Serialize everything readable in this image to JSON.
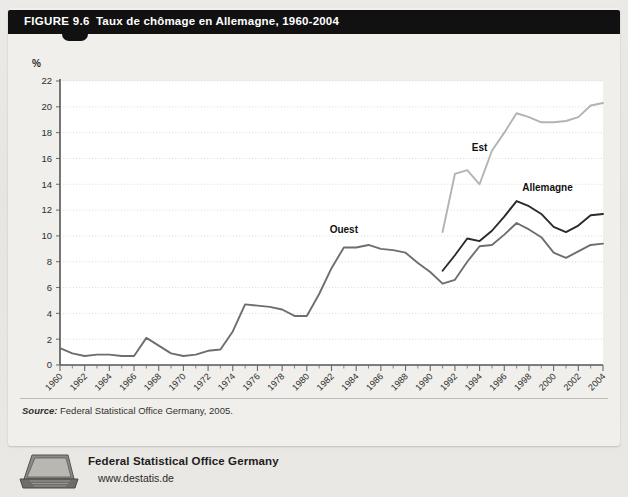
{
  "figure": {
    "number_label": "FIGURE 9.6",
    "title": "Taux de chômage en Allemagne, 1960-2004"
  },
  "source": {
    "prefix": "Source:",
    "text": " Federal Statistical Office Germany, 2005."
  },
  "footer": {
    "organization": "Federal Statistical Office Germany",
    "website": "www.destatis.de",
    "icon": "laptop-icon"
  },
  "colors": {
    "titlebar_bg": "#111111",
    "page_bg": "#eceae6",
    "plot_bg": "#ffffff",
    "est_line": "#b3b3b3",
    "allemagne_line": "#2a2a2a",
    "ouest_line": "#6e6e6e",
    "grid": "#cfcfcf",
    "axis": "#6a6a6a"
  },
  "chart_data": {
    "type": "line",
    "title": "Taux de chômage en Allemagne, 1960-2004",
    "xlabel": "",
    "ylabel": "%",
    "ylim": [
      0,
      22
    ],
    "xlim": [
      1960,
      2004
    ],
    "ytick_step": 2,
    "yticks": [
      0,
      2,
      4,
      6,
      8,
      10,
      12,
      14,
      16,
      18,
      20,
      22
    ],
    "xticks": [
      1960,
      1962,
      1964,
      1966,
      1968,
      1970,
      1972,
      1974,
      1976,
      1978,
      1980,
      1982,
      1984,
      1986,
      1988,
      1990,
      1992,
      1994,
      1996,
      1998,
      2000,
      2002,
      2004
    ],
    "grid": "horizontal-dotted",
    "legend_position": "inline-annotations",
    "annotations": [
      {
        "label": "Ouest",
        "x": 1983,
        "y": 10.2
      },
      {
        "label": "Est",
        "x": 1994,
        "y": 16.6
      },
      {
        "label": "Allemagne",
        "x": 1999.5,
        "y": 13.5
      }
    ],
    "series": [
      {
        "name": "Ouest",
        "color": "#6e6e6e",
        "x": [
          1960,
          1961,
          1962,
          1963,
          1964,
          1965,
          1966,
          1967,
          1968,
          1969,
          1970,
          1971,
          1972,
          1973,
          1974,
          1975,
          1976,
          1977,
          1978,
          1979,
          1980,
          1981,
          1982,
          1983,
          1984,
          1985,
          1986,
          1987,
          1988,
          1989,
          1990,
          1991,
          1992,
          1993,
          1994,
          1995,
          1996,
          1997,
          1998,
          1999,
          2000,
          2001,
          2002,
          2003,
          2004
        ],
        "values": [
          1.3,
          0.9,
          0.7,
          0.8,
          0.8,
          0.7,
          0.7,
          2.1,
          1.5,
          0.9,
          0.7,
          0.8,
          1.1,
          1.2,
          2.6,
          4.7,
          4.6,
          4.5,
          4.3,
          3.8,
          3.8,
          5.5,
          7.5,
          9.1,
          9.1,
          9.3,
          9.0,
          8.9,
          8.7,
          7.9,
          7.2,
          6.3,
          6.6,
          8.0,
          9.2,
          9.3,
          10.1,
          11.0,
          10.5,
          9.9,
          8.7,
          8.3,
          8.8,
          9.3,
          9.4
        ]
      },
      {
        "name": "Est",
        "color": "#b3b3b3",
        "x": [
          1991,
          1992,
          1993,
          1994,
          1995,
          1996,
          1997,
          1998,
          1999,
          2000,
          2001,
          2002,
          2003,
          2004
        ],
        "values": [
          10.3,
          14.8,
          15.1,
          14.0,
          16.6,
          18.0,
          19.5,
          19.2,
          18.8,
          18.8,
          18.9,
          19.2,
          20.1,
          20.3
        ]
      },
      {
        "name": "Allemagne",
        "color": "#2a2a2a",
        "x": [
          1991,
          1992,
          1993,
          1994,
          1995,
          1996,
          1997,
          1998,
          1999,
          2000,
          2001,
          2002,
          2003,
          2004
        ],
        "values": [
          7.3,
          8.5,
          9.8,
          9.6,
          10.4,
          11.5,
          12.7,
          12.3,
          11.7,
          10.7,
          10.3,
          10.8,
          11.6,
          11.7
        ]
      }
    ]
  }
}
